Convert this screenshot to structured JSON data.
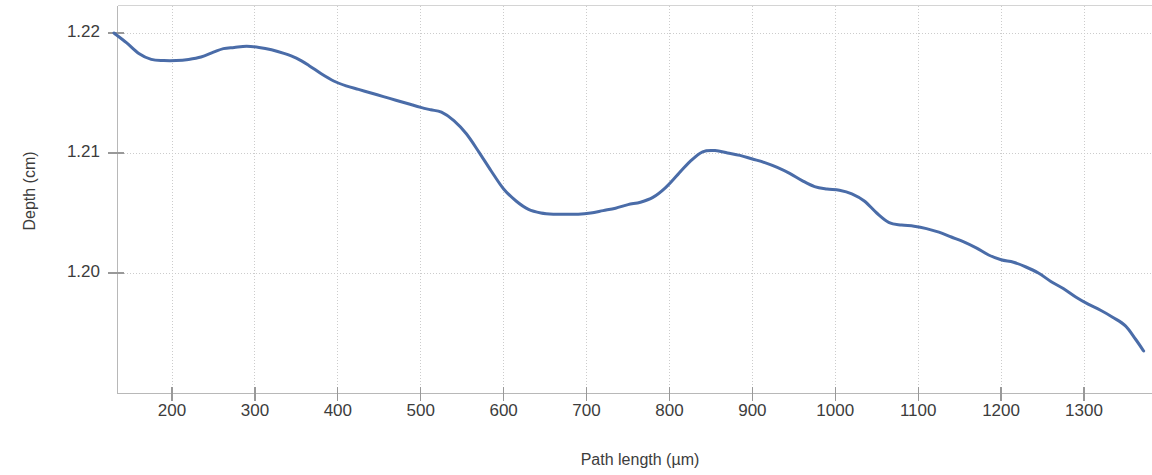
{
  "caption": {
    "fragment": ")"
  },
  "chart_data": {
    "type": "line",
    "title": "",
    "xlabel": "Path length (µm)",
    "ylabel": "Depth (cm)",
    "xlim": [
      130,
      1372
    ],
    "ylim": [
      1.1935,
      1.2224
    ],
    "xticks": [
      200,
      300,
      400,
      500,
      600,
      700,
      800,
      900,
      1000,
      1100,
      1200,
      1300
    ],
    "xticklabels": [
      "200",
      "300",
      "400",
      "500",
      "600",
      "700",
      "800",
      "900",
      "1000",
      "1100",
      "1200",
      "1300"
    ],
    "yticks": [
      1.2,
      1.21,
      1.22
    ],
    "yticklabels": [
      "1.20",
      "1.21",
      "1.22"
    ],
    "grid": true,
    "grid_color": "#cccccc",
    "legend": null,
    "line_color": "#4a6ca8",
    "line_width": 3,
    "series": [
      {
        "name": "Depth profile",
        "x": [
          130,
          145,
          160,
          175,
          190,
          205,
          220,
          235,
          250,
          262,
          275,
          290,
          305,
          320,
          335,
          350,
          365,
          380,
          395,
          410,
          425,
          440,
          455,
          470,
          485,
          500,
          512,
          525,
          540,
          555,
          570,
          585,
          600,
          615,
          630,
          645,
          660,
          675,
          690,
          705,
          720,
          735,
          750,
          765,
          780,
          795,
          810,
          825,
          840,
          855,
          870,
          885,
          900,
          915,
          930,
          945,
          960,
          975,
          990,
          1005,
          1020,
          1035,
          1050,
          1065,
          1080,
          1095,
          1110,
          1125,
          1140,
          1155,
          1170,
          1185,
          1200,
          1215,
          1230,
          1245,
          1260,
          1275,
          1290,
          1305,
          1320,
          1335,
          1350,
          1362,
          1372
        ],
        "y": [
          1.22,
          1.2192,
          1.2183,
          1.2178,
          1.2177,
          1.2177,
          1.2178,
          1.218,
          1.2184,
          1.2187,
          1.2188,
          1.2189,
          1.2188,
          1.2186,
          1.2183,
          1.2179,
          1.2173,
          1.2166,
          1.216,
          1.2156,
          1.2153,
          1.215,
          1.2147,
          1.2144,
          1.2141,
          1.2138,
          1.2136,
          1.2134,
          1.2127,
          1.2116,
          1.2101,
          1.2085,
          1.207,
          1.206,
          1.2053,
          1.205,
          1.2049,
          1.2049,
          1.2049,
          1.205,
          1.2052,
          1.2054,
          1.2057,
          1.2059,
          1.2063,
          1.2071,
          1.2082,
          1.2093,
          1.2101,
          1.2102,
          1.21,
          1.2098,
          1.2095,
          1.2092,
          1.2088,
          1.2083,
          1.2077,
          1.2072,
          1.207,
          1.2069,
          1.2066,
          1.206,
          1.205,
          1.2042,
          1.204,
          1.2039,
          1.2037,
          1.2034,
          1.203,
          1.2026,
          1.2021,
          1.2015,
          1.2011,
          1.2009,
          1.2005,
          1.2,
          1.1993,
          1.1987,
          1.198,
          1.1974,
          1.1969,
          1.1963,
          1.1956,
          1.1945,
          1.1935
        ]
      }
    ]
  }
}
